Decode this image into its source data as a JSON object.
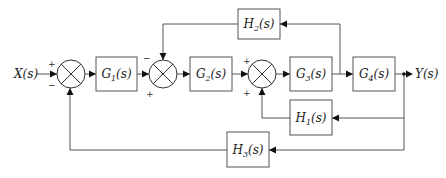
{
  "diagram": {
    "type": "control-system block diagram",
    "input": {
      "label": "X(s)"
    },
    "output": {
      "label": "Y(s)"
    },
    "blocks": [
      {
        "id": "G1",
        "base": "G",
        "sub": "1",
        "suffix": "(s)"
      },
      {
        "id": "G2",
        "base": "G",
        "sub": "2",
        "suffix": "(s)"
      },
      {
        "id": "G3",
        "base": "G",
        "sub": "3",
        "suffix": "(s)"
      },
      {
        "id": "G4",
        "base": "G",
        "sub": "4",
        "suffix": "(s)"
      },
      {
        "id": "H1",
        "base": "H",
        "sub": "1",
        "suffix": "(s)"
      },
      {
        "id": "H2",
        "base": "H",
        "sub": "2",
        "suffix": "(s)"
      },
      {
        "id": "H3",
        "base": "H",
        "sub": "3",
        "suffix": "(s)"
      }
    ],
    "summing_junctions": [
      {
        "id": "S1",
        "signs": {
          "left": "+",
          "bottom": "−"
        }
      },
      {
        "id": "S2",
        "signs": {
          "left": "+",
          "top": "−"
        }
      },
      {
        "id": "S3",
        "signs": {
          "left": "+",
          "bottom": "+"
        }
      }
    ],
    "connections": [
      "X(s) → S1 (+)",
      "S1 → G1",
      "G1 → S2 (+)",
      "S2 → G2",
      "G2 → S3 (+)",
      "S3 → G3",
      "G3 → G4",
      "G4 → Y(s)",
      "G3 output → H2 → S2 (−)",
      "Y(s) → H1 → S3 (+)",
      "Y(s) → H3 → S1 (−)"
    ]
  }
}
